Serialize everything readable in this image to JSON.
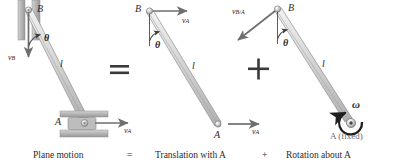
{
  "figure": {
    "background_color": "#ffffff",
    "bar_color": "#d9d9d9",
    "bar_edge_color": "#8a8a8a",
    "arrow_color": "#6e6e6e",
    "text_color": "#2b2b2b",
    "guide_color": "#a8a8a8"
  },
  "operators": {
    "equals": "=",
    "plus": "+"
  },
  "captions": {
    "panel1": "Plane motion",
    "equals": "=",
    "panel2": "Translation with A",
    "plus": "+",
    "panel3": "Rotation about A"
  },
  "panels": [
    {
      "id": "plane-motion",
      "caption": "Plane motion",
      "labels": {
        "point_b": "B",
        "point_a": "A",
        "length": "l",
        "angle": "θ",
        "velocity_b": "v",
        "velocity_b_sub": "B",
        "velocity_a": "v",
        "velocity_a_sub": "A"
      },
      "vectors": [
        {
          "name": "v_B",
          "at": "B",
          "direction": "down"
        },
        {
          "name": "v_A",
          "at": "A",
          "direction": "right"
        }
      ],
      "constraints": [
        "vertical guide at B",
        "horizontal guide at A"
      ]
    },
    {
      "id": "translation-with-a",
      "caption": "Translation with A",
      "labels": {
        "point_b": "B",
        "point_a": "A",
        "length": "l",
        "angle": "θ",
        "velocity_b": "v",
        "velocity_b_sub": "A",
        "velocity_a": "v",
        "velocity_a_sub": "A"
      },
      "vectors": [
        {
          "name": "v_A",
          "at": "B",
          "direction": "right"
        },
        {
          "name": "v_A",
          "at": "A",
          "direction": "right"
        }
      ]
    },
    {
      "id": "rotation-about-a",
      "caption": "Rotation about A",
      "labels": {
        "point_b": "B",
        "point_a": "A",
        "point_a_note": "A (fixed)",
        "length": "l",
        "angle": "θ",
        "velocity_rel": "v",
        "velocity_rel_sub": "B/A",
        "omega": "ω"
      },
      "vectors": [
        {
          "name": "v_B/A",
          "at": "B",
          "direction": "down-left"
        },
        {
          "name": "omega",
          "at": "A",
          "direction": "counterclockwise"
        }
      ]
    }
  ]
}
